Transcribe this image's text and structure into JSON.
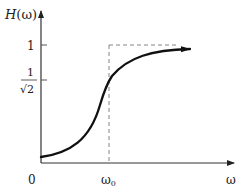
{
  "diagram": {
    "y_axis": {
      "label_fn": "H",
      "label_arg": "(ω)"
    },
    "x_axis": {
      "label": "ω",
      "origin_label": "0"
    },
    "ticks": {
      "one": "1",
      "half_root_num": "1",
      "half_root_den": "√2",
      "omega0": "ω",
      "omega0_sub": "0"
    },
    "colors": {
      "curve": "#111111",
      "axis": "#333333",
      "dashed": "#777777"
    }
  }
}
